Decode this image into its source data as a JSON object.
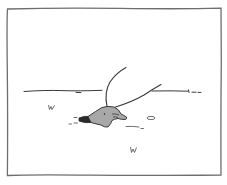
{
  "panel": {
    "description": "Comic panel: gray mole-like creature emerging from a dark hole in flat ground with two long curved antenna-like lines",
    "colors": {
      "background": "#ffffff",
      "line": "#3a3a3a",
      "frame": "#6e6e6e",
      "creature_fill": "#a8a8a8",
      "hole_fill": "#2a2a2a"
    },
    "elements": [
      "frame-border",
      "horizon-line",
      "creature",
      "hole",
      "antenna-left",
      "antenna-right",
      "grass-tuft-left",
      "grass-tuft-bottom",
      "pebble",
      "dirt-marks"
    ]
  }
}
